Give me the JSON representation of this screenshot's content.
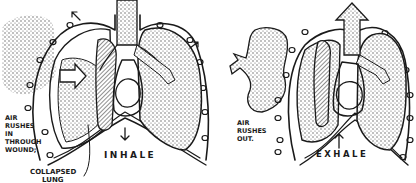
{
  "diagram": {
    "panels": [
      {
        "id": "inhale",
        "phase_label": "INHALE",
        "wound_label_lines": [
          "AIR",
          "RUSHES",
          "IN",
          "THROUGH",
          "WOUND;"
        ],
        "callout_lines": [
          "COLLAPSED",
          "LUNG"
        ]
      },
      {
        "id": "exhale",
        "phase_label": "EXHALE",
        "wound_label_lines": [
          "AIR",
          "RUSHES",
          "OUT."
        ]
      }
    ],
    "colors": {
      "ink": "#1a1a1a",
      "background": "#ffffff",
      "stipple": "#555555"
    }
  }
}
